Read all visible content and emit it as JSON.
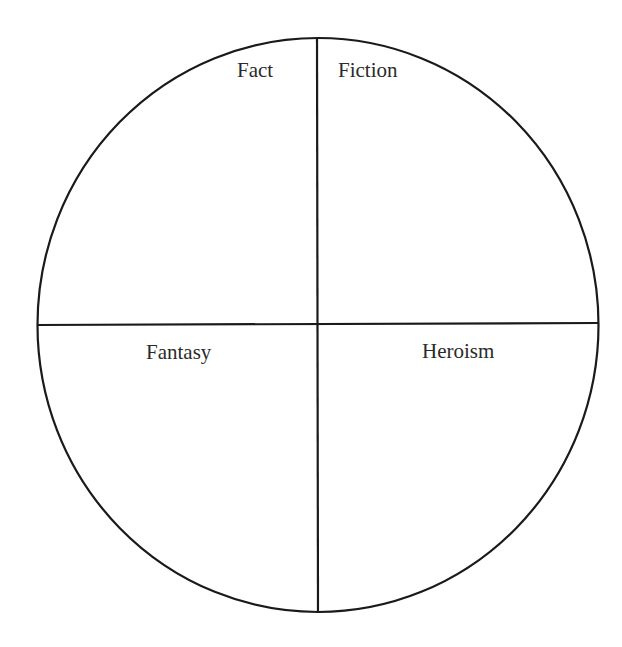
{
  "diagram": {
    "type": "quadrant-circle",
    "stroke_color": "#1a1a1a",
    "background": "#ffffff",
    "quadrants": [
      {
        "position": "top-left",
        "label": "Fact"
      },
      {
        "position": "top-right",
        "label": "Fiction"
      },
      {
        "position": "bottom-left",
        "label": "Fantasy"
      },
      {
        "position": "bottom-right",
        "label": "Heroism"
      }
    ]
  }
}
